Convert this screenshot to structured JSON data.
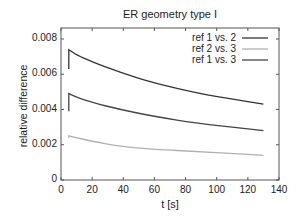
{
  "chart_data": {
    "type": "line",
    "title": "ER geometry type I",
    "xlabel": "t [s]",
    "ylabel": "relative difference",
    "xlim": [
      0,
      140
    ],
    "ylim": [
      0,
      0.0085
    ],
    "xticks": [
      0,
      20,
      40,
      60,
      80,
      100,
      120,
      140
    ],
    "xtick_labels": [
      "0",
      "20",
      "40",
      "60",
      "80",
      "100",
      "120",
      "140"
    ],
    "yticks": [
      0,
      0.002,
      0.004,
      0.006,
      0.008
    ],
    "ytick_labels": [
      "0",
      "0.002",
      "0.004",
      "0.006",
      "0.008"
    ],
    "grid": false,
    "legend_position": "top-right",
    "series": [
      {
        "name": "ref 1 vs. 2",
        "color": "#333333",
        "x": [
          5,
          5,
          10,
          20,
          38,
          60,
          89,
          110,
          130
        ],
        "y": [
          0.0063,
          0.0074,
          0.0071,
          0.0067,
          0.0061,
          0.0055,
          0.0049,
          0.0046,
          0.0043
        ]
      },
      {
        "name": "ref 2 vs. 3",
        "color": "#b0b0b0",
        "x": [
          5,
          5,
          10,
          20,
          38,
          60,
          89,
          110,
          130
        ],
        "y": [
          0.0024,
          0.0025,
          0.0024,
          0.0022,
          0.0019,
          0.00175,
          0.0016,
          0.0015,
          0.0014
        ]
      },
      {
        "name": "ref 1 vs. 3",
        "color": "#444444",
        "x": [
          5,
          5,
          10,
          20,
          38,
          60,
          89,
          110,
          130
        ],
        "y": [
          0.0039,
          0.0049,
          0.0047,
          0.0044,
          0.004,
          0.0036,
          0.0032,
          0.003,
          0.0028
        ]
      }
    ]
  }
}
